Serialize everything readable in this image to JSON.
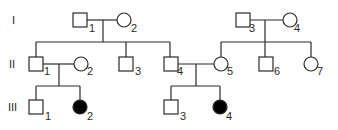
{
  "diagram": {
    "type": "pedigree",
    "colors": {
      "line": "#2a2a2a",
      "affected_fill": "#000000",
      "unaffected_fill": "#ffffff"
    },
    "generations": [
      {
        "label": "I",
        "individuals": [
          {
            "id": "1",
            "sex": "male",
            "affected": false
          },
          {
            "id": "2",
            "sex": "female",
            "affected": false
          },
          {
            "id": "3",
            "sex": "male",
            "affected": false
          },
          {
            "id": "4",
            "sex": "female",
            "affected": false
          }
        ]
      },
      {
        "label": "II",
        "individuals": [
          {
            "id": "1",
            "sex": "male",
            "affected": false
          },
          {
            "id": "2",
            "sex": "female",
            "affected": false
          },
          {
            "id": "3",
            "sex": "male",
            "affected": false
          },
          {
            "id": "4",
            "sex": "male",
            "affected": false
          },
          {
            "id": "5",
            "sex": "female",
            "affected": false
          },
          {
            "id": "6",
            "sex": "male",
            "affected": false
          },
          {
            "id": "7",
            "sex": "female",
            "affected": false
          }
        ]
      },
      {
        "label": "III",
        "individuals": [
          {
            "id": "1",
            "sex": "male",
            "affected": false
          },
          {
            "id": "2",
            "sex": "female",
            "affected": true
          },
          {
            "id": "3",
            "sex": "male",
            "affected": false
          },
          {
            "id": "4",
            "sex": "female",
            "affected": true
          }
        ]
      }
    ],
    "matings": [
      {
        "partners": [
          "I-1",
          "I-2"
        ],
        "children": [
          "II-1",
          "II-3",
          "II-4"
        ]
      },
      {
        "partners": [
          "I-3",
          "I-4"
        ],
        "children": [
          "II-5",
          "II-6",
          "II-7"
        ]
      },
      {
        "partners": [
          "II-1",
          "II-2"
        ],
        "children": [
          "III-1",
          "III-2"
        ]
      },
      {
        "partners": [
          "II-4",
          "II-5"
        ],
        "children": [
          "III-3",
          "III-4"
        ]
      }
    ]
  }
}
